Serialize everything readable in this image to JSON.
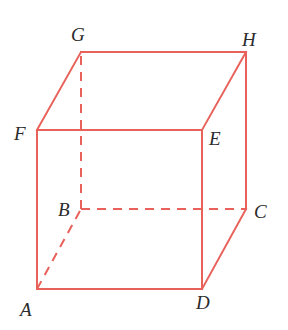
{
  "figure": {
    "type": "cube",
    "colors": {
      "edge": "#e8615a",
      "label": "#2b2b2b",
      "background": "#ffffff"
    },
    "vertices": {
      "A": {
        "x": 37,
        "y": 289,
        "label": "A"
      },
      "B": {
        "x": 81,
        "y": 209,
        "label": "B"
      },
      "C": {
        "x": 246,
        "y": 209,
        "label": "C"
      },
      "D": {
        "x": 202,
        "y": 289,
        "label": "D"
      },
      "E": {
        "x": 202,
        "y": 130,
        "label": "E"
      },
      "F": {
        "x": 37,
        "y": 130,
        "label": "F"
      },
      "G": {
        "x": 81,
        "y": 52,
        "label": "G"
      },
      "H": {
        "x": 246,
        "y": 52,
        "label": "H"
      }
    },
    "solid_edges": [
      "AD",
      "AF",
      "FE",
      "ED",
      "FG",
      "GH",
      "HE",
      "HC",
      "CD"
    ],
    "dashed_edges": [
      "AB",
      "BC",
      "BG"
    ],
    "labels": {
      "A": "A",
      "B": "B",
      "C": "C",
      "D": "D",
      "E": "E",
      "F": "F",
      "G": "G",
      "H": "H"
    }
  }
}
